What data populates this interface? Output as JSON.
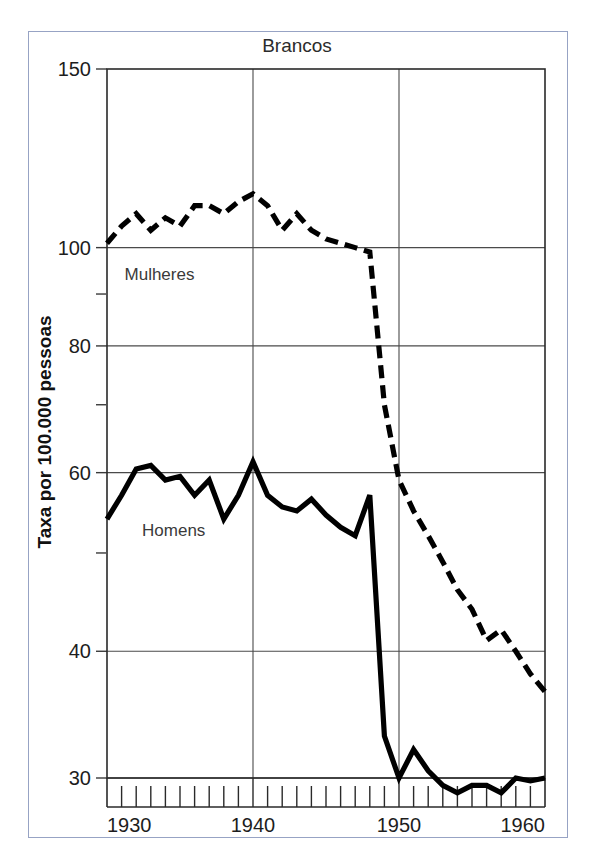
{
  "figure": {
    "title": "Brancos",
    "ylabel": "Taxa por 100.000 pessoas",
    "border_color": "#97a3c4"
  },
  "chart_data": {
    "type": "line",
    "title": "Brancos",
    "xlabel": "",
    "ylabel": "Taxa por 100.000 pessoas",
    "yscale": "log",
    "ylim": [
      30,
      150
    ],
    "xlim": [
      1930,
      1960
    ],
    "grid": true,
    "legend_position": "inline-annotation",
    "y_major_ticks": [
      30,
      40,
      60,
      80,
      100,
      150
    ],
    "y_minor_ticks": [
      50,
      70,
      90
    ],
    "y_tick_labels": [
      "30",
      "40",
      "60",
      "80",
      "100",
      "150"
    ],
    "x_major_ticks": [
      1930,
      1940,
      1950,
      1960
    ],
    "x_tick_labels": [
      "1930",
      "1940",
      "1950",
      "1960"
    ],
    "x_minor_tick_step": 1,
    "x": [
      1930,
      1931,
      1932,
      1933,
      1934,
      1935,
      1936,
      1937,
      1938,
      1939,
      1940,
      1941,
      1942,
      1943,
      1944,
      1945,
      1946,
      1947,
      1948,
      1949,
      1950,
      1951,
      1952,
      1953,
      1954,
      1955,
      1956,
      1957,
      1958,
      1959,
      1960
    ],
    "series": [
      {
        "name": "Mulheres",
        "label": "Mulheres",
        "style": "dashed",
        "color": "#000000",
        "label_x": 1931.2,
        "label_y": 93,
        "values": [
          101,
          105,
          108,
          104,
          107,
          105,
          110,
          110,
          108,
          111,
          113,
          110,
          104,
          108,
          104,
          102,
          101,
          100,
          99,
          70,
          59,
          55,
          52,
          49,
          46,
          44,
          41,
          42,
          40,
          38,
          36.5
        ]
      },
      {
        "name": "Homens",
        "label": "Homens",
        "style": "solid",
        "color": "#000000",
        "label_x": 1932.4,
        "label_y": 52,
        "values": [
          54,
          57,
          60.5,
          61,
          59,
          59.5,
          57,
          59,
          54,
          57,
          61.5,
          57,
          55.5,
          55,
          56.5,
          54.5,
          53,
          52,
          57,
          33,
          30,
          32,
          30.5,
          29.5,
          29,
          29.5,
          29.5,
          29,
          30,
          29.8,
          30
        ]
      }
    ],
    "annotations": [
      {
        "text": "Mulheres",
        "x": 1931.2,
        "y": 93
      },
      {
        "text": "Homens",
        "x": 1932.4,
        "y": 52
      }
    ]
  }
}
